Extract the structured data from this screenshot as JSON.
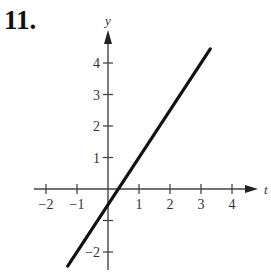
{
  "problem_number": "11.",
  "chart_data": {
    "type": "line",
    "title": "",
    "xlabel": "t",
    "ylabel": "y",
    "x_ticks": [
      -2,
      -1,
      1,
      2,
      3,
      4
    ],
    "y_ticks": [
      -2,
      -1,
      1,
      2,
      3,
      4
    ],
    "x_tick_labels": [
      "−2",
      "−1",
      "1",
      "2",
      "3",
      "4"
    ],
    "y_tick_labels": [
      "−2",
      "1",
      "2",
      "3",
      "4"
    ],
    "xlim": [
      -2.3,
      5.2
    ],
    "ylim": [
      -2.6,
      5.3
    ],
    "grid": false,
    "series": [
      {
        "name": "line",
        "equation": "y = 1.5t - 0.5",
        "x": [
          -1.3,
          3.3
        ],
        "y": [
          -2.45,
          4.45
        ]
      }
    ]
  }
}
